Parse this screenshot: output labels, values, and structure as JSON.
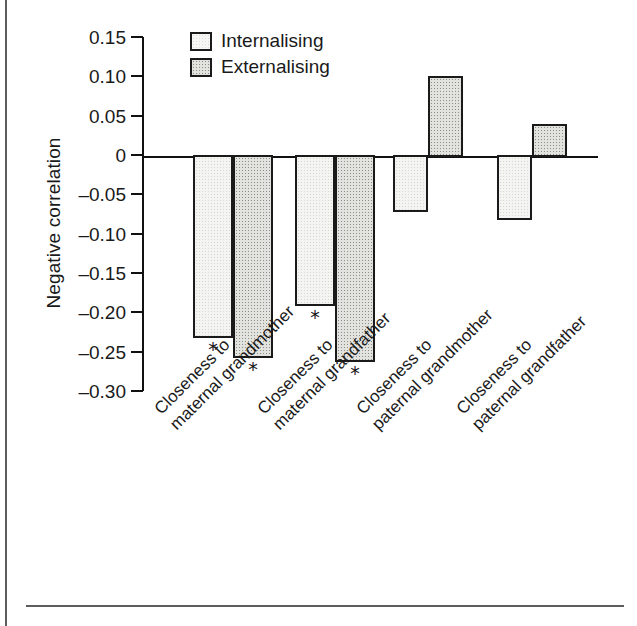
{
  "chart_data": {
    "type": "bar",
    "title": "",
    "xlabel": "",
    "ylabel": "Negative correlation",
    "ylim": [
      -0.3,
      0.15
    ],
    "yticks": [
      0.15,
      0.1,
      0.05,
      0,
      -0.05,
      -0.1,
      -0.15,
      -0.2,
      -0.25,
      -0.3
    ],
    "ytick_labels": [
      "0.15",
      "0.10",
      "0.05",
      "0",
      "–0.05",
      "–0.10",
      "–0.15",
      "–0.20",
      "–0.25",
      "–0.30"
    ],
    "grid": false,
    "legend_position": "top-left-inside",
    "categories": [
      "Closeness to maternal grandmother",
      "Closeness to maternal grandfather",
      "Closeness to paternal grandmother",
      "Closeness to paternal grandfather"
    ],
    "category_lines": [
      {
        "line1": "Closeness to",
        "line2": "maternal grandmother"
      },
      {
        "line1": "Closeness to",
        "line2": "maternal grandfather"
      },
      {
        "line1": "Closeness to",
        "line2": "paternal grandmother"
      },
      {
        "line1": "Closeness to",
        "line2": "paternal grandfather"
      }
    ],
    "series": [
      {
        "name": "Internalising",
        "values": [
          -0.23,
          -0.19,
          -0.07,
          -0.08
        ],
        "significance": [
          "*",
          "*",
          "",
          ""
        ],
        "fill": "#f4f4f2"
      },
      {
        "name": "Externalising",
        "values": [
          -0.255,
          -0.26,
          0.1,
          0.04
        ],
        "significance": [
          "*",
          "*",
          "",
          ""
        ],
        "fill": "#e2e2de"
      }
    ],
    "annotation_note": "* marks statistically significant correlations"
  },
  "legend": {
    "items": [
      {
        "label": "Internalising",
        "key": "internalising"
      },
      {
        "label": "Externalising",
        "key": "externalising"
      }
    ]
  },
  "axis": {
    "y_title": "Negative correlation"
  }
}
